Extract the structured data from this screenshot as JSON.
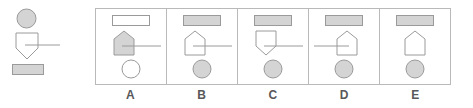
{
  "colors": {
    "fill_gray": "#d4d4d4",
    "stroke_gray": "#9a9a9a",
    "stroke_light": "#b9b9b9",
    "white": "#ffffff",
    "label_text": "#58585a",
    "background": "#ffffff"
  },
  "stimulus": {
    "name": "stimulus-figure",
    "elements": [
      {
        "shape": "circle",
        "fill": "filled",
        "position": "top"
      },
      {
        "shape": "shield-down",
        "fill": "unfilled",
        "position": "middle",
        "connector": "line-right"
      },
      {
        "shape": "rectangle",
        "fill": "filled",
        "position": "bottom"
      }
    ]
  },
  "options": [
    {
      "label": "A",
      "top": {
        "shape": "rectangle",
        "fill": "unfilled"
      },
      "middle": {
        "shape": "pentagon-up",
        "fill": "filled",
        "connector": "line-right"
      },
      "bottom": {
        "shape": "circle",
        "fill": "unfilled"
      }
    },
    {
      "label": "B",
      "top": {
        "shape": "rectangle",
        "fill": "filled"
      },
      "middle": {
        "shape": "pentagon-up",
        "fill": "unfilled",
        "connector": "line-right"
      },
      "bottom": {
        "shape": "circle",
        "fill": "filled"
      }
    },
    {
      "label": "C",
      "top": {
        "shape": "rectangle",
        "fill": "filled"
      },
      "middle": {
        "shape": "shield-down",
        "fill": "unfilled",
        "connector": "line-right"
      },
      "bottom": {
        "shape": "circle",
        "fill": "filled"
      }
    },
    {
      "label": "D",
      "top": {
        "shape": "rectangle",
        "fill": "filled"
      },
      "middle": {
        "shape": "pentagon-up",
        "fill": "unfilled",
        "connector": "line-left"
      },
      "bottom": {
        "shape": "circle",
        "fill": "filled"
      }
    },
    {
      "label": "E",
      "top": {
        "shape": "rectangle",
        "fill": "filled"
      },
      "middle": {
        "shape": "pentagon-up",
        "fill": "unfilled",
        "connector": "none"
      },
      "bottom": {
        "shape": "circle",
        "fill": "filled"
      }
    }
  ],
  "labels": [
    "A",
    "B",
    "C",
    "D",
    "E"
  ]
}
